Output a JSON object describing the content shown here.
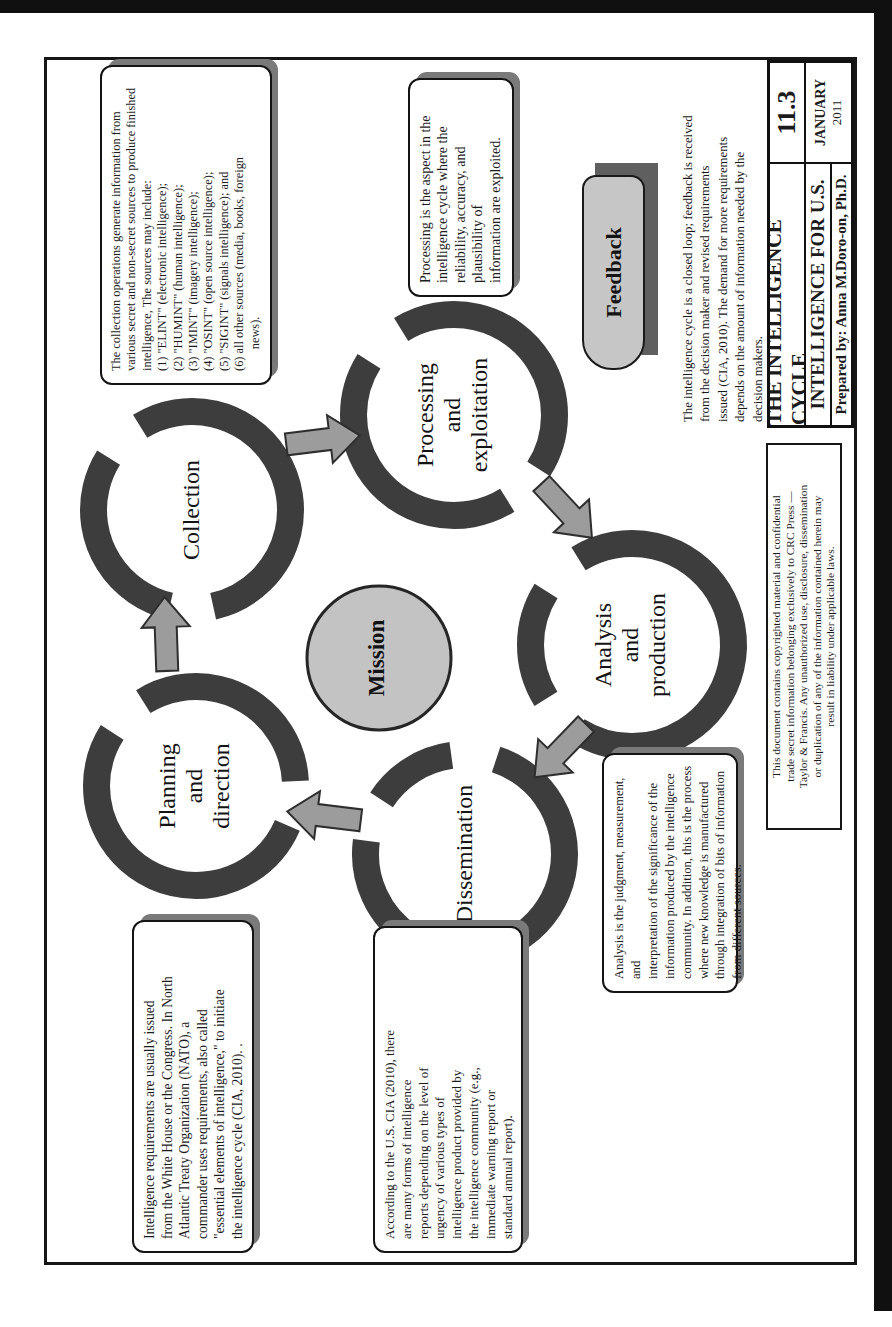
{
  "figure": {
    "kind": "intelligence-cycle-diagram",
    "orientation": "landscape page rotated 90 degrees counterclockwise into portrait scan"
  },
  "title_block": {
    "title": "THE INTELLIGENCE CYCLE",
    "figure_number": "11.3",
    "subtitle": "INTELLIGENCE FOR U.S.",
    "date_month": "JANUARY",
    "date_year": "2011",
    "prepared_by": "Prepared by: Anna M.Doro-on, Ph.D."
  },
  "cycle": {
    "center_label": "Mission",
    "nodes": [
      {
        "id": "planning",
        "label": "Planning\nand\ndirection"
      },
      {
        "id": "collection",
        "label": "Collection"
      },
      {
        "id": "processing",
        "label": "Processing\nand\nexploitation"
      },
      {
        "id": "analysis",
        "label": "Analysis\nand\nproduction"
      },
      {
        "id": "dissemination",
        "label": "Dissemination"
      }
    ],
    "flow": [
      "Planning and direction",
      "Collection",
      "Processing and exploitation",
      "Analysis and production",
      "Dissemination",
      "Planning and direction"
    ]
  },
  "notes": {
    "collection": "The collection operations generate information from\nvarious secret and non-secret sources to produce finished\nintelligence, The sources may include:\n(1) \"ELINT\" (electronic intelligence);\n(2) \"HUMINT\" (human intelligence);\n(3) \"IMINT\" (imagery intelligence);\n(4) \"OSINT\" (open source intelligence);\n(5) \"SIGINT\" (signals intelligence); and\n(6) all other sources (media, books, foreign\n       news).",
    "processing": "Processing is the aspect in the\nintelligence cycle where the\nreliability, accuracy, and\nplausibility of\ninformation are exploited.",
    "analysis": "Analysis is the judgment, measurement, and\ninterpretation of the significance of the\ninformation produced by the intelligence\ncommunity. In addition, this is the process\nwhere new knowledge is manufactured\nthrough integration of bits of information\nfrom different sources.",
    "planning": "Intelligence requirements are usually issued\nfrom the White House or the Congress. In North\nAtlantic Treaty Organization (NATO), a\ncommander uses requirements, also called\n\"essential elements of intelligence,\" to initiate\nthe intelligence cycle (CIA, 2010). .",
    "dissemination": "According to the U.S. CIA (2010), there\nare many forms of intelligence\nreports depending on the level of\nurgency of various types of\nintelligence product provided by\nthe intelligence community (e.g.,\nimmediate warning report or\nstandard annual report)."
  },
  "feedback": {
    "button_label": "Feedback",
    "paragraph": "The intelligence cycle is a closed loop; feedback is received\nfrom the decision maker and revised requirements\nissued (CIA, 2010). The demand for more requirements\ndepends on the amount of information needed by the\ndecision makers."
  },
  "copyright_notice": "This document contains copyrighted material and confidential\ntrade secret information belonging exclusively to CRC Press —\nTaylor & Francis. Any unauthorized use, disclosure, dissemination\nor duplication of any of the information contained herein may\nresult in liability under applicable laws.",
  "colors": {
    "ring": "#3d3d3d",
    "arrow_fill": "#9c9c9c",
    "arrow_stroke": "#2e2e2e",
    "mission_fill": "#c3c3c3",
    "feedback_fill": "#c6c6c6",
    "shadow": "#6b6b6b",
    "frame": "#161616"
  }
}
